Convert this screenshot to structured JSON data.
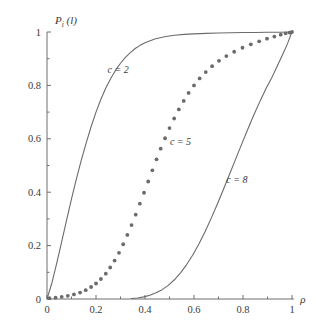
{
  "chart_data": {
    "type": "line",
    "title": "",
    "xlabel": "ρ",
    "ylabel": "P",
    "ylabel_sub": "i",
    "ylabel_arg": "(l)",
    "xlim": [
      0,
      1
    ],
    "ylim": [
      0,
      1
    ],
    "grid": false,
    "legend": "inline-curve-labels",
    "xticks": [
      "0",
      "0.2",
      "0.4",
      "0.6",
      "0.8",
      "1"
    ],
    "xtick_values": [
      0,
      0.2,
      0.4,
      0.6,
      0.8,
      1
    ],
    "yticks": [
      "0",
      "0.2",
      "0.4",
      "0.6",
      "0.8",
      "1"
    ],
    "ytick_values": [
      0,
      0.2,
      0.4,
      0.6,
      0.8,
      1
    ],
    "minor_ticks": true,
    "line_color": "#6b6b6b",
    "axis_color": "#6e6e6e",
    "text_color": "#3a3a3a",
    "series": [
      {
        "name": "c = 2",
        "style": "solid",
        "label": "c = 2",
        "label_x": 0.29,
        "label_y": 0.845,
        "x": [
          0.0,
          0.02,
          0.04,
          0.06,
          0.08,
          0.1,
          0.12,
          0.14,
          0.16,
          0.18,
          0.2,
          0.22,
          0.24,
          0.26,
          0.28,
          0.3,
          0.32,
          0.34,
          0.36,
          0.38,
          0.4,
          0.44,
          0.48,
          0.52,
          0.56,
          0.6,
          0.65,
          0.7,
          0.75,
          0.8,
          0.85,
          0.9,
          0.95,
          1.0
        ],
        "y": [
          0.0,
          0.06,
          0.135,
          0.215,
          0.295,
          0.375,
          0.45,
          0.52,
          0.585,
          0.645,
          0.7,
          0.748,
          0.79,
          0.826,
          0.857,
          0.883,
          0.905,
          0.923,
          0.938,
          0.95,
          0.96,
          0.974,
          0.982,
          0.988,
          0.991,
          0.993,
          0.995,
          0.996,
          0.997,
          0.998,
          0.998,
          0.999,
          0.999,
          1.0
        ]
      },
      {
        "name": "c = 5",
        "style": "dotted",
        "label": "c = 5",
        "label_x": 0.545,
        "label_y": 0.575,
        "x": [
          0.01,
          0.035,
          0.06,
          0.085,
          0.11,
          0.135,
          0.158,
          0.18,
          0.2,
          0.22,
          0.24,
          0.258,
          0.276,
          0.294,
          0.311,
          0.328,
          0.345,
          0.362,
          0.379,
          0.396,
          0.413,
          0.43,
          0.447,
          0.464,
          0.482,
          0.5,
          0.519,
          0.538,
          0.558,
          0.578,
          0.6,
          0.623,
          0.648,
          0.674,
          0.702,
          0.732,
          0.764,
          0.798,
          0.832,
          0.866,
          0.898,
          0.928,
          0.954,
          0.974,
          0.99,
          1.0
        ],
        "y": [
          0.003,
          0.005,
          0.008,
          0.012,
          0.017,
          0.024,
          0.033,
          0.045,
          0.058,
          0.075,
          0.095,
          0.118,
          0.144,
          0.173,
          0.205,
          0.24,
          0.277,
          0.316,
          0.357,
          0.398,
          0.44,
          0.482,
          0.523,
          0.563,
          0.602,
          0.64,
          0.676,
          0.71,
          0.742,
          0.772,
          0.8,
          0.826,
          0.85,
          0.872,
          0.892,
          0.91,
          0.926,
          0.941,
          0.954,
          0.965,
          0.975,
          0.983,
          0.99,
          0.995,
          0.998,
          1.0
        ]
      },
      {
        "name": "c = 8",
        "style": "solid",
        "label": "c = 8",
        "label_x": 0.775,
        "label_y": 0.435,
        "x": [
          0.345,
          0.37,
          0.395,
          0.42,
          0.445,
          0.47,
          0.495,
          0.52,
          0.545,
          0.57,
          0.595,
          0.62,
          0.645,
          0.67,
          0.695,
          0.72,
          0.745,
          0.77,
          0.795,
          0.82,
          0.845,
          0.87,
          0.895,
          0.918,
          0.94,
          0.958,
          0.972,
          0.984,
          0.993,
          1.0
        ],
        "y": [
          0.002,
          0.004,
          0.008,
          0.014,
          0.023,
          0.035,
          0.051,
          0.072,
          0.098,
          0.129,
          0.165,
          0.206,
          0.252,
          0.302,
          0.355,
          0.41,
          0.467,
          0.524,
          0.581,
          0.637,
          0.691,
          0.742,
          0.79,
          0.83,
          0.873,
          0.908,
          0.936,
          0.962,
          0.984,
          1.0
        ]
      }
    ]
  }
}
